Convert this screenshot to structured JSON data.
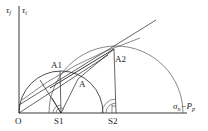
{
  "diagram": {
    "type": "mohr-circle",
    "colors": {
      "stroke": "#222222",
      "faint": "#555555",
      "background": "#ffffff"
    },
    "axes": {
      "vertical_labels": [
        "τf",
        "τt"
      ],
      "tau_f_main": "τ",
      "tau_f_sub": "f",
      "tau_t_main": "τ",
      "tau_t_sub": "t",
      "horizontal_label_main": "σ",
      "horizontal_label_sub": "n",
      "horizontal_label_minus": "−P",
      "horizontal_label_sub2": "p"
    },
    "points": {
      "origin": "O",
      "s1": "S1",
      "s2": "S2",
      "a": "A",
      "a1": "A1",
      "a2": "A2"
    }
  }
}
